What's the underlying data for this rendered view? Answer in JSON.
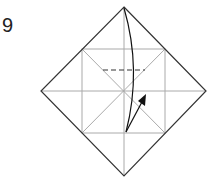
{
  "step_number": "9",
  "colors": {
    "outline": "#333333",
    "crease": "#aaaaaa",
    "dashed": "#333333",
    "arrow": "#111111"
  }
}
